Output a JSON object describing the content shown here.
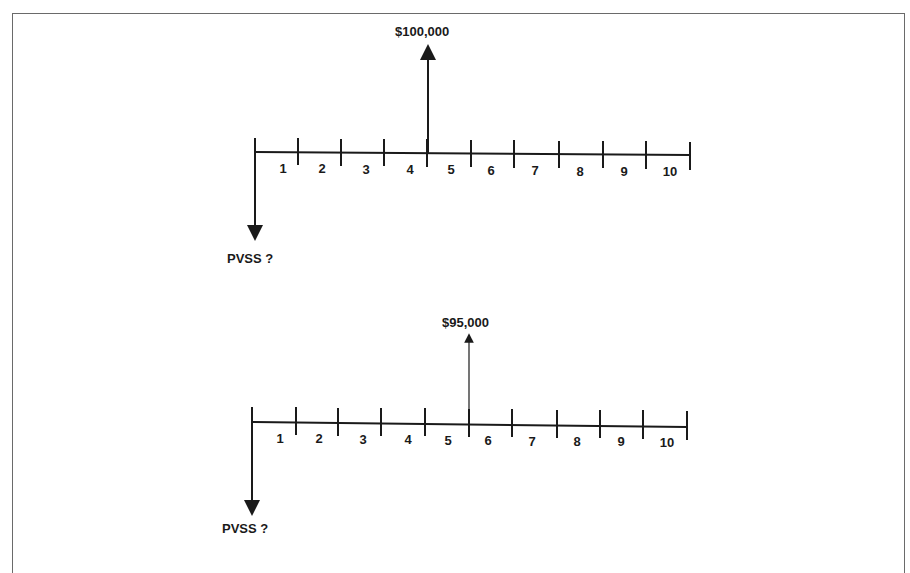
{
  "diagrams": [
    {
      "name": "timeline-1",
      "periods": [
        "1",
        "2",
        "3",
        "4",
        "5",
        "6",
        "7",
        "8",
        "9",
        "10"
      ],
      "cash_flow": {
        "label": "$100,000",
        "at_period_end": 4,
        "direction": "up"
      },
      "present_value": {
        "label": "PVSS ?",
        "direction": "down"
      }
    },
    {
      "name": "timeline-2",
      "periods": [
        "1",
        "2",
        "3",
        "4",
        "5",
        "6",
        "7",
        "8",
        "9",
        "10"
      ],
      "cash_flow": {
        "label": "$95,000",
        "at_period_end": 5,
        "direction": "up"
      },
      "present_value": {
        "label": "PVSS ?",
        "direction": "down"
      }
    }
  ],
  "colors": {
    "line": "#1a1a1a",
    "border": "#6a6a6a"
  }
}
